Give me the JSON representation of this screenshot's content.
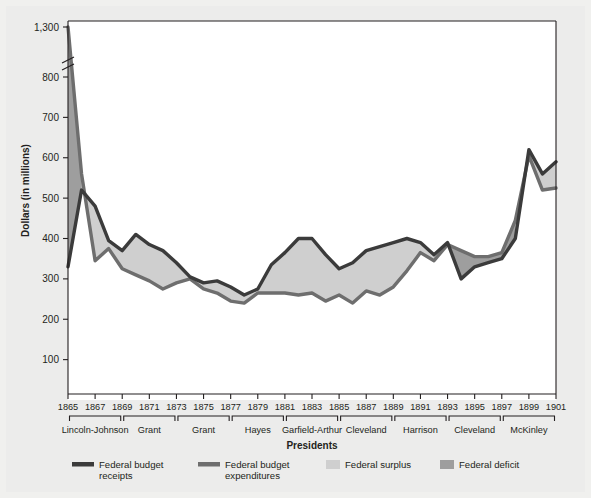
{
  "chart_data": {
    "type": "area",
    "title": "",
    "xlabel": "Presidents",
    "ylabel": "Dollars (in millions)",
    "x": [
      1865,
      1866,
      1867,
      1868,
      1869,
      1870,
      1871,
      1872,
      1873,
      1874,
      1875,
      1876,
      1877,
      1878,
      1879,
      1880,
      1881,
      1882,
      1883,
      1884,
      1885,
      1886,
      1887,
      1888,
      1889,
      1890,
      1891,
      1892,
      1893,
      1894,
      1895,
      1896,
      1897,
      1898,
      1899,
      1900,
      1901
    ],
    "x_tick_labels": [
      "1865",
      "1867",
      "1869",
      "1871",
      "1873",
      "1875",
      "1877",
      "1879",
      "1881",
      "1883",
      "1885",
      "1887",
      "1889",
      "1891",
      "1893",
      "1895",
      "1897",
      "1899",
      "1901"
    ],
    "y_tick_labels": [
      "1,300",
      "800",
      "700",
      "600",
      "500",
      "400",
      "300",
      "200",
      "100"
    ],
    "y_ticks": [
      1300,
      800,
      700,
      600,
      500,
      400,
      300,
      200,
      100
    ],
    "ylim": [
      0,
      1300
    ],
    "axis_break": true,
    "axis_break_between": [
      800,
      1300
    ],
    "grid": false,
    "legend_position": "bottom",
    "series": [
      {
        "name": "Federal budget receipts",
        "key": "receipts",
        "color": "#3b3b3b",
        "values": [
          330,
          520,
          480,
          395,
          370,
          410,
          385,
          370,
          340,
          305,
          290,
          295,
          280,
          260,
          275,
          335,
          365,
          400,
          400,
          360,
          325,
          340,
          370,
          380,
          390,
          400,
          390,
          360,
          390,
          300,
          330,
          340,
          350,
          400,
          620,
          560,
          590
        ]
      },
      {
        "name": "Federal budget expenditures",
        "key": "expenditures",
        "color": "#6e6e6e",
        "values": [
          1300,
          560,
          345,
          375,
          325,
          310,
          295,
          275,
          290,
          300,
          275,
          265,
          245,
          240,
          265,
          265,
          265,
          260,
          265,
          245,
          260,
          240,
          270,
          260,
          280,
          320,
          365,
          345,
          385,
          370,
          355,
          355,
          365,
          445,
          605,
          520,
          525
        ]
      }
    ],
    "fills": {
      "surplus": {
        "label": "Federal surplus",
        "color": "#cfcfcf"
      },
      "deficit": {
        "label": "Federal deficit",
        "color": "#9e9e9e"
      }
    },
    "president_groups": [
      {
        "label": "Lincoln-Johnson",
        "start": 1865,
        "end": 1869
      },
      {
        "label": "Grant",
        "start": 1869,
        "end": 1873
      },
      {
        "label": "Grant",
        "start": 1873,
        "end": 1877
      },
      {
        "label": "Hayes",
        "start": 1877,
        "end": 1881
      },
      {
        "label": "Garfield-Arthur",
        "start": 1881,
        "end": 1885
      },
      {
        "label": "Cleveland",
        "start": 1885,
        "end": 1889
      },
      {
        "label": "Harrison",
        "start": 1889,
        "end": 1893
      },
      {
        "label": "Cleveland",
        "start": 1893,
        "end": 1897
      },
      {
        "label": "McKinley",
        "start": 1897,
        "end": 1901
      }
    ],
    "legend": [
      {
        "label_line1": "Federal budget",
        "label_line2": "receipts",
        "type": "line",
        "color": "#3b3b3b"
      },
      {
        "label_line1": "Federal budget",
        "label_line2": "expenditures",
        "type": "line",
        "color": "#6e6e6e"
      },
      {
        "label_line1": "Federal surplus",
        "label_line2": "",
        "type": "swatch",
        "color": "#cfcfcf"
      },
      {
        "label_line1": "Federal deficit",
        "label_line2": "",
        "type": "swatch",
        "color": "#9e9e9e"
      }
    ]
  },
  "colors": {
    "page_background": "#f0f0ee",
    "frame_background": "#ececeb",
    "plot_background": "#ffffff",
    "axis": "#231f20",
    "receipts_line": "#3b3b3b",
    "expenditures_line": "#6e6e6e",
    "surplus_fill": "#cfcfcf",
    "deficit_fill": "#9e9e9e"
  }
}
